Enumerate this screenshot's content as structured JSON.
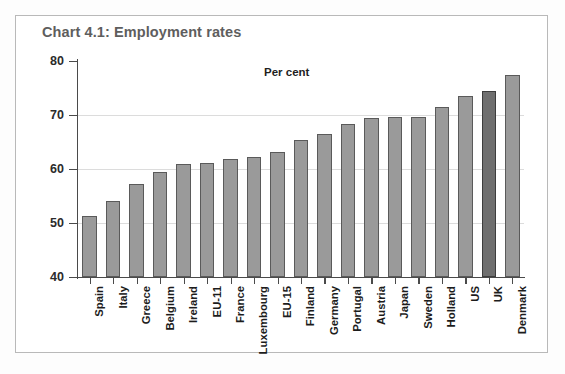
{
  "figure": {
    "title": "Chart 4.1: Employment rates",
    "annotation": "Per cent",
    "border_color": "#b9b9b9",
    "title_color": "#5e5e5e"
  },
  "chart_data": {
    "type": "bar",
    "title": "Chart 4.1: Employment rates",
    "subtitle": "",
    "annotations": [
      "Per cent"
    ],
    "xlabel": "",
    "ylabel": "Per cent",
    "ylim": [
      40,
      80
    ],
    "yticks": [
      40,
      50,
      60,
      70,
      80
    ],
    "ytick_labels": [
      "40",
      "50",
      "60",
      "70",
      "80"
    ],
    "grid": true,
    "legend": "none",
    "bar_color": "#9a9a9a",
    "highlight_color": "#6f6f6f",
    "highlight_category": "UK",
    "categories": [
      "Spain",
      "Italy",
      "Greece",
      "Belgium",
      "Ireland",
      "EU-11",
      "France",
      "Luxembourg",
      "EU-15",
      "Finland",
      "Germany",
      "Portugal",
      "Austria",
      "Japan",
      "Sweden",
      "Holland",
      "US",
      "UK",
      "Denmark"
    ],
    "values": [
      51.3,
      54.0,
      57.3,
      59.5,
      61.0,
      61.2,
      61.9,
      62.2,
      63.2,
      65.3,
      66.5,
      68.4,
      69.4,
      69.6,
      69.7,
      71.5,
      73.5,
      74.5,
      77.4
    ]
  }
}
